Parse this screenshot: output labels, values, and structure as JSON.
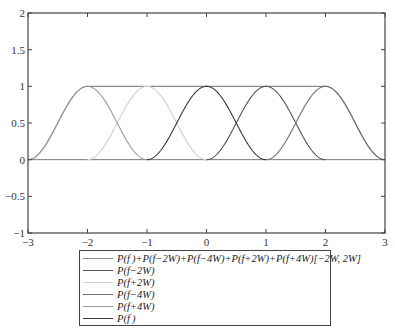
{
  "chart_data": {
    "type": "line",
    "title": "",
    "xlabel": "",
    "ylabel": "",
    "xlim": [
      -3,
      3
    ],
    "ylim": [
      -1,
      2
    ],
    "x_ticks": [
      -3,
      -2,
      -1,
      0,
      1,
      2,
      3
    ],
    "x_tick_labels": [
      "−3",
      "−2",
      "−1",
      "0",
      "1",
      "2",
      "3"
    ],
    "y_ticks": [
      -1,
      -0.5,
      0,
      0.5,
      1,
      1.5,
      2
    ],
    "y_tick_labels": [
      "−1",
      "−0.5",
      "0",
      "0.5",
      "1",
      "1.5",
      "2"
    ],
    "grid": false,
    "legend_position": "below-plot",
    "pulse_description": "raised-cosine pulse P(f) of half-width 1 (f from -1 to 1), peak 1 at center; shifted copies at ±2W, ±4W with W = 0.5",
    "series": [
      {
        "name": "P(f)+P(f−2W)+P(f−4W)+P(f+2W)+P(f+4W)[−2W, 2W]",
        "color": "#8a8a8a",
        "kind": "sum",
        "x": [
          -3,
          -2.5,
          -2,
          -1,
          0,
          1,
          2,
          2.5,
          3
        ],
        "y": [
          0,
          0.5,
          1,
          1,
          1,
          1,
          1,
          0.5,
          0
        ]
      },
      {
        "name": "P(f−2W)",
        "color": "#555555",
        "center": 1,
        "x": [
          0,
          0.5,
          1,
          1.5,
          2
        ],
        "y": [
          0,
          0.5,
          1,
          0.5,
          0
        ]
      },
      {
        "name": "P(f+2W)",
        "color": "#d0d0d0",
        "center": -1,
        "x": [
          -2,
          -1.5,
          -1,
          -0.5,
          0
        ],
        "y": [
          0,
          0.5,
          1,
          0.5,
          0
        ]
      },
      {
        "name": "P(f−4W)",
        "color": "#707070",
        "center": 2,
        "x": [
          1,
          1.5,
          2,
          2.5,
          3
        ],
        "y": [
          0,
          0.5,
          1,
          0.5,
          0
        ]
      },
      {
        "name": "P(f+4W)",
        "color": "#9a9a9a",
        "center": -2,
        "x": [
          -3,
          -2.5,
          -2,
          -1.5,
          -1
        ],
        "y": [
          0,
          0.5,
          1,
          0.5,
          0
        ]
      },
      {
        "name": "P(f)",
        "color": "#3a3a3a",
        "center": 0,
        "x": [
          -1,
          -0.5,
          0,
          0.5,
          1
        ],
        "y": [
          0,
          0.5,
          1,
          0.5,
          0
        ]
      }
    ]
  },
  "legend": {
    "items": [
      {
        "label": "P(f )+P(f−2W)+P(f−4W)+P(f+2W)+P(f+4W)[−2W, 2W]",
        "color": "#8a8a8a"
      },
      {
        "label": "P(f−2W)",
        "color": "#555555"
      },
      {
        "label": "P(f+2W)",
        "color": "#d0d0d0"
      },
      {
        "label": "P(f−4W)",
        "color": "#707070"
      },
      {
        "label": "P(f+4W)",
        "color": "#9a9a9a"
      },
      {
        "label": "P(f )",
        "color": "#3a3a3a"
      }
    ]
  }
}
